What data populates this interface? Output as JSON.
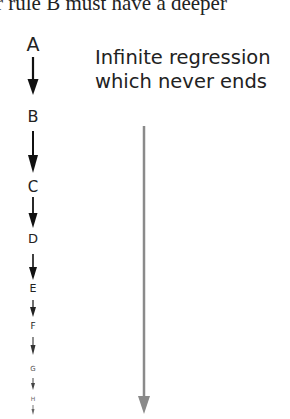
{
  "header": {
    "cropped_text": "r rule B must have a deeper"
  },
  "caption": {
    "line1": "Infinite regression",
    "line2": "which never ends"
  },
  "chain": {
    "labels": [
      "A",
      "B",
      "C",
      "D",
      "E",
      "F",
      "G",
      "H"
    ]
  },
  "colors": {
    "chain_arrow": "#111111",
    "long_arrow": "#8a8a8a",
    "text": "#222222"
  }
}
